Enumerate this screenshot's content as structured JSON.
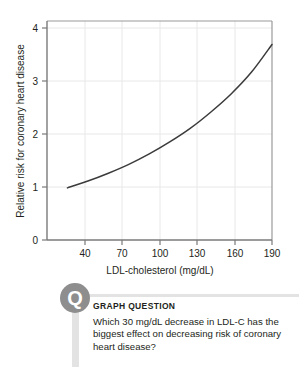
{
  "chart_data": {
    "type": "line",
    "title": "",
    "xlabel": "LDL-cholesterol (mg/dL)",
    "ylabel": "Relative risk for coronary heart disease",
    "xlim": [
      25,
      190
    ],
    "ylim": [
      0,
      4.2
    ],
    "xticks": [
      40,
      70,
      100,
      130,
      160,
      190
    ],
    "yticks": [
      0,
      1,
      2,
      3,
      4
    ],
    "xtick_labels": [
      "40",
      "70",
      "100",
      "130",
      "160",
      "190"
    ],
    "ytick_labels": [
      "0",
      "1",
      "2",
      "3",
      "4"
    ],
    "grid": true,
    "legend": "none",
    "series": [
      {
        "name": "Relative risk for coronary heart disease",
        "color": "#3b3b3b",
        "x": [
          40,
          55,
          70,
          85,
          100,
          115,
          130,
          145,
          160,
          175,
          190
        ],
        "values": [
          1.0,
          1.13,
          1.28,
          1.45,
          1.65,
          1.88,
          2.14,
          2.45,
          2.8,
          3.22,
          3.75
        ]
      }
    ]
  },
  "question": {
    "icon": "question-mark-circle-icon",
    "label": "GRAPH QUESTION",
    "text": "Which 30 mg/dL decrease in LDL-C has the biggest effect on decreasing risk of coronary heart disease?",
    "badge_glyph": "Q"
  },
  "colors": {
    "curve": "#3b3b3b",
    "axis": "#808080",
    "grid": "#e8e8e8",
    "badge": "#8e8e8e",
    "stem": "#e3e3e3",
    "text": "#231f20"
  }
}
